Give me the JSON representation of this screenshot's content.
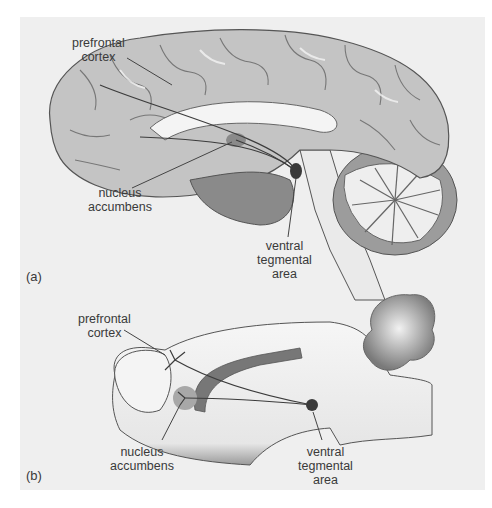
{
  "figure": {
    "panels": [
      {
        "id": "a",
        "label": "(a)",
        "subject": "human brain, midsagittal view",
        "labels": {
          "prefrontal_line1": "prefrontal",
          "prefrontal_line2": "cortex",
          "nucleus_line1": "nucleus",
          "nucleus_line2": "accumbens",
          "vta_line1": "ventral",
          "vta_line2": "tegmental",
          "vta_line3": "area"
        }
      },
      {
        "id": "b",
        "label": "(b)",
        "subject": "rat brain, sagittal view",
        "labels": {
          "prefrontal_line1": "prefrontal",
          "prefrontal_line2": "cortex",
          "nucleus_line1": "nucleus",
          "nucleus_line2": "accumbens",
          "vta_line1": "ventral",
          "vta_line2": "tegmental",
          "vta_line3": "area"
        }
      }
    ],
    "colors": {
      "background": "#efefef",
      "cortex": "#c4c4c4",
      "pathway": "#3c3c3c",
      "nucleus_fill": "#8a8a8a",
      "vta_fill": "#3a3a3a"
    }
  }
}
